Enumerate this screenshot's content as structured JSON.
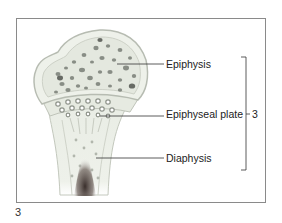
{
  "figure": {
    "number": "3",
    "labels": {
      "epiphysis": "Epiphysis",
      "epiphyseal_plate": "Epiphyseal plate",
      "diaphysis": "Diaphysis"
    },
    "bracket_label": "3"
  },
  "colors": {
    "frame": "#8a8a8a",
    "bone_fill": "#ecefe8",
    "bone_outline": "#b7bcb2",
    "spongy_holes": "#6a6f68",
    "marrow_dark": "#3a2f2c",
    "leader_line": "#333333"
  }
}
